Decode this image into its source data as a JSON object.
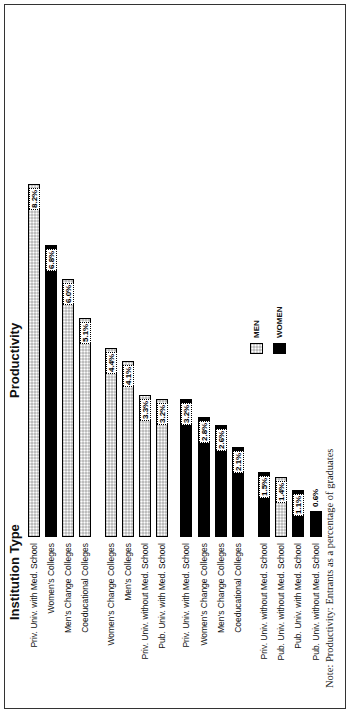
{
  "chart_data": {
    "type": "bar",
    "orientation": "horizontal (rotated page)",
    "title": "Productivity",
    "category_axis_title": "Institution Type",
    "note": "Note: Productivity: Entrants as a percentage of graduates",
    "legend": [
      {
        "name": "MEN",
        "pattern": "dotted-gray"
      },
      {
        "name": "WOMEN",
        "pattern": "solid-black"
      }
    ],
    "bars": [
      {
        "category": "Priv. Univ. with Med. School",
        "series": "MEN",
        "value": 8.2,
        "label": "8.2%"
      },
      {
        "category": "Women's Colleges",
        "series": "WOMEN",
        "value": 6.8,
        "label": "6.8%"
      },
      {
        "category": "Men's Change Colleges",
        "series": "MEN",
        "value": 6.0,
        "label": "6.0%"
      },
      {
        "category": "Coeducational Colleges",
        "series": "MEN",
        "value": 5.1,
        "label": "5.1%"
      },
      {
        "category": "Women's Change Colleges",
        "series": "MEN",
        "value": 4.4,
        "label": "4.4%"
      },
      {
        "category": "Men's Colleges",
        "series": "MEN",
        "value": 4.1,
        "label": "4.1%"
      },
      {
        "category": "Priv. Univ. without Med. School",
        "series": "MEN",
        "value": 3.3,
        "label": "3.3%"
      },
      {
        "category": "Pub. Univ. with Med. School",
        "series": "MEN",
        "value": 3.2,
        "label": "3.2%"
      },
      {
        "category": "Priv. Univ. with Med. School",
        "series": "WOMEN",
        "value": 3.2,
        "label": "3.2%"
      },
      {
        "category": "Women's Change Colleges",
        "series": "WOMEN",
        "value": 2.8,
        "label": "2.8%"
      },
      {
        "category": "Men's Change Colleges",
        "series": "WOMEN",
        "value": 2.6,
        "label": "2.6%"
      },
      {
        "category": "Coeducational Colleges",
        "series": "WOMEN",
        "value": 2.1,
        "label": "2.1%"
      },
      {
        "category": "Priv. Univ. without Med. School",
        "series": "WOMEN",
        "value": 1.5,
        "label": "1.5%"
      },
      {
        "category": "Pub. Univ. without Med. School",
        "series": "MEN",
        "value": 1.4,
        "label": "1.4%"
      },
      {
        "category": "Pub. Univ. with Med. School",
        "series": "WOMEN",
        "value": 1.1,
        "label": "1.1%"
      },
      {
        "category": "Pub. Univ. without Med. School",
        "series": "WOMEN",
        "value": 0.6,
        "label": "0.6%"
      }
    ],
    "categories": [
      "Priv. Univ. with Med. School",
      "Women's Colleges",
      "Men's Change Colleges",
      "Coeducational Colleges",
      "Women's Change Colleges",
      "Men's Colleges",
      "Priv. Univ. without Med. School",
      "Pub. Univ. with Med. School",
      "Priv. Univ. with Med. School",
      "Women's Change Colleges",
      "Men's Change Colleges",
      "Coeducational Colleges",
      "Priv. Univ. without Med. School",
      "Pub. Univ. without Med. School",
      "Pub. Univ. with Med. School",
      "Pub. Univ. without Med. School"
    ],
    "values": [
      8.2,
      6.8,
      6.0,
      5.1,
      4.4,
      4.1,
      3.3,
      3.2,
      3.2,
      2.8,
      2.6,
      2.1,
      1.5,
      1.4,
      1.1,
      0.6
    ],
    "xlabel": "Institution Type",
    "ylabel": "Productivity",
    "ylim": [
      0,
      8.5
    ],
    "grid": false,
    "legend_position": "lower right (rotated)"
  }
}
